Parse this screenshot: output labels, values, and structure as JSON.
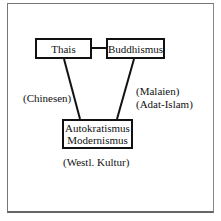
{
  "diagram": {
    "nodes": {
      "thais": "Thais",
      "buddhismus": "Buddhismus",
      "autokratismus": "Autokratismus",
      "modernismus": "Modernismus"
    },
    "labels": {
      "chinesen": "(Chinesen)",
      "malaien": "(Malaien)",
      "adat_islam": "(Adat-Islam)",
      "westl_kultur": "(Westl. Kultur)"
    },
    "edges": [
      {
        "from": "Thais",
        "to": "Buddhismus"
      },
      {
        "from": "Thais",
        "to": "Autokratismus / Modernismus"
      },
      {
        "from": "Buddhismus",
        "to": "Autokratismus / Modernismus"
      }
    ],
    "colors": {
      "line": "#111111",
      "frame": "#777777",
      "background": "#ffffff"
    }
  }
}
